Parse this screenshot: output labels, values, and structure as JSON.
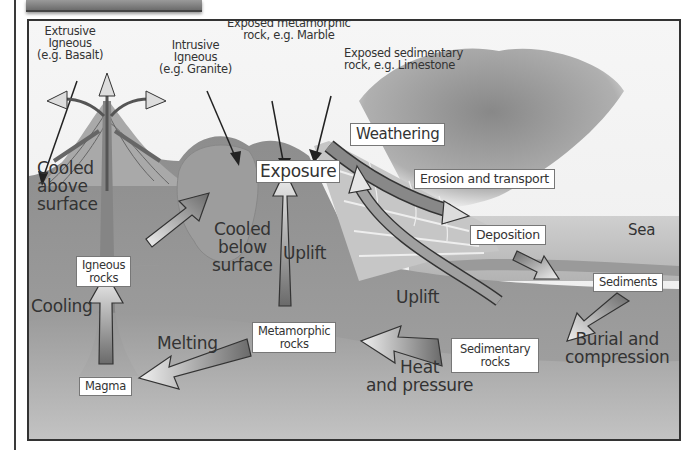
{
  "diagram": {
    "type": "rock-cycle",
    "colors": {
      "frame_border": "#333333",
      "background": "#f4f4f4",
      "ground": "#8f8f8f",
      "sea": "#b9b9b9",
      "cloud": "#8a8a8a",
      "arrow_dark": "#6e6e6e",
      "arrow_light": "#e8e8e8",
      "text": "#333333"
    },
    "annotations": {
      "extrusive": [
        "Extrusive",
        "Igneous",
        "(e.g. Basalt)"
      ],
      "intrusive": [
        "Intrusive",
        "Igneous",
        "(e.g. Granite)"
      ],
      "exposed_metamorphic": [
        "Exposed metamorphic",
        "rock, e.g. Marble"
      ],
      "exposed_sedimentary": [
        "Exposed sedimentary",
        "rock, e.g. Limestone"
      ],
      "sea": "Sea"
    },
    "process_labels": {
      "cooled_above": [
        "Cooled",
        "above",
        "surface"
      ],
      "cooled_below": [
        "Cooled",
        "below",
        "surface"
      ],
      "cooling": "Cooling",
      "melting": "Melting",
      "uplift_1": "Uplift",
      "uplift_2": "Uplift",
      "heat_pressure": [
        "Heat",
        "and pressure"
      ],
      "burial": [
        "Burial and",
        "compression"
      ]
    },
    "boxes": {
      "weathering": "Weathering",
      "exposure": "Exposure",
      "erosion": "Erosion and transport",
      "deposition": "Deposition",
      "sediments": "Sediments",
      "igneous": [
        "Igneous",
        "rocks"
      ],
      "metamorphic": [
        "Metamorphic",
        "rocks"
      ],
      "sedimentary": [
        "Sedimentary",
        "rocks"
      ],
      "magma": "Magma"
    }
  }
}
